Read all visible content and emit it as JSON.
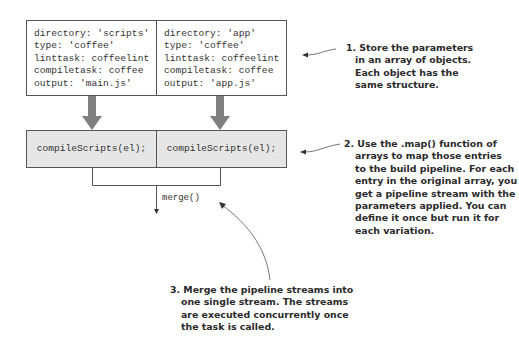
{
  "objects": [
    {
      "lines": [
        "directory: 'scripts'",
        "type: 'coffee'",
        "linttask: coffeelint",
        "compiletask: coffee",
        "output: 'main.js'"
      ]
    },
    {
      "lines": [
        "directory: 'app'",
        "type: 'coffee'",
        "linttask: coffeelint",
        "compiletask: coffee",
        "output: 'app.js'"
      ]
    }
  ],
  "pipelines": [
    {
      "label": "compileScripts(el);"
    },
    {
      "label": "compileScripts(el);"
    }
  ],
  "merge_label": "merge()",
  "notes": [
    {
      "lines": [
        "1. Store the parameters",
        "in an array of objects.",
        "Each object has the",
        "same structure."
      ]
    },
    {
      "lines": [
        "2. Use the .map() function of",
        "arrays to map those entries",
        "to the build pipeline. For each",
        "entry in the original array, you",
        "get a pipeline stream with the",
        "parameters applied. You can",
        "define it once but run it for",
        "each variation."
      ]
    },
    {
      "lines": [
        "3. Merge the pipeline streams into",
        "one single stream. The streams",
        "are executed concurrently once",
        "the task is called."
      ]
    }
  ],
  "colors": {
    "arrow_fill": "#808080",
    "box_gray": "#e6e6e6",
    "line": "#555555"
  }
}
